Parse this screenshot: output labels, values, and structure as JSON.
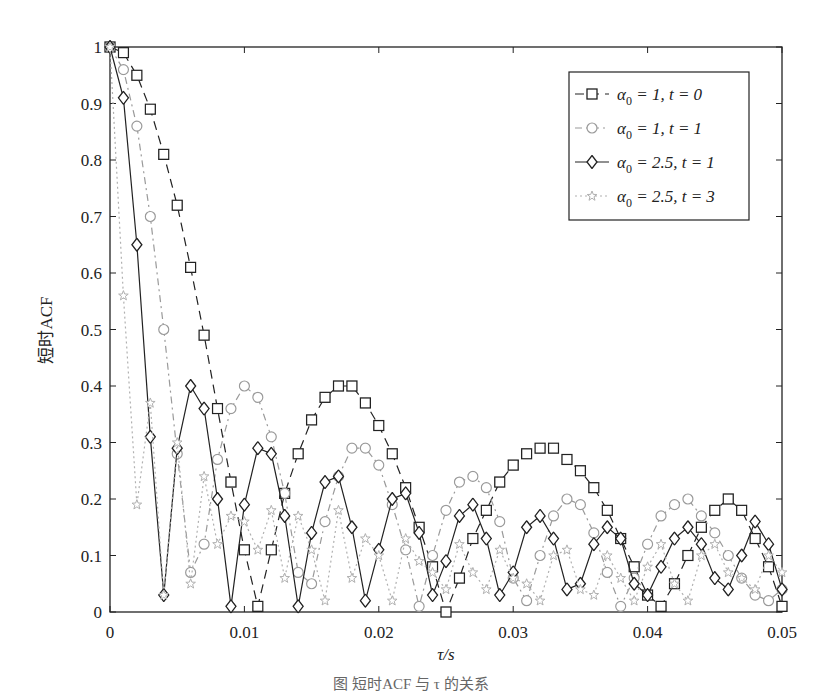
{
  "chart_data": {
    "type": "line",
    "title": "",
    "xlabel": "τ/s",
    "ylabel": "短时ACF",
    "xlim": [
      0,
      0.05
    ],
    "ylim": [
      0,
      1
    ],
    "xticks": [
      0,
      0.01,
      0.02,
      0.03,
      0.04,
      0.05
    ],
    "xtick_labels": [
      "0",
      "0.01",
      "0.02",
      "0.03",
      "0.04",
      "0.05"
    ],
    "yticks": [
      0,
      0.1,
      0.2,
      0.3,
      0.4,
      0.5,
      0.6,
      0.7,
      0.8,
      0.9,
      1
    ],
    "ytick_labels": [
      "0",
      "0.1",
      "0.2",
      "0.3",
      "0.4",
      "0.5",
      "0.6",
      "0.7",
      "0.8",
      "0.9",
      "1"
    ],
    "grid": false,
    "legend_position": "upper right",
    "x": [
      0,
      0.001,
      0.002,
      0.003,
      0.004,
      0.005,
      0.006,
      0.007,
      0.008,
      0.009,
      0.01,
      0.011,
      0.012,
      0.013,
      0.014,
      0.015,
      0.016,
      0.017,
      0.018,
      0.019,
      0.02,
      0.021,
      0.022,
      0.023,
      0.024,
      0.025,
      0.026,
      0.027,
      0.028,
      0.029,
      0.03,
      0.031,
      0.032,
      0.033,
      0.034,
      0.035,
      0.036,
      0.037,
      0.038,
      0.039,
      0.04,
      0.041,
      0.042,
      0.043,
      0.044,
      0.045,
      0.046,
      0.047,
      0.048,
      0.049,
      0.05
    ],
    "series": [
      {
        "name": "α0 = 1,  t = 0",
        "legend_main": "α",
        "legend_sub": "0",
        "legend_rest": " = 1,  t = 0",
        "marker": "square",
        "line_style": "dashed",
        "color": "#222222",
        "values": [
          1.0,
          0.99,
          0.95,
          0.89,
          0.81,
          0.72,
          0.61,
          0.49,
          0.36,
          0.23,
          0.11,
          0.01,
          0.11,
          0.21,
          0.28,
          0.34,
          0.38,
          0.4,
          0.4,
          0.37,
          0.33,
          0.28,
          0.22,
          0.15,
          0.08,
          0.0,
          0.06,
          0.13,
          0.18,
          0.23,
          0.26,
          0.28,
          0.29,
          0.29,
          0.27,
          0.25,
          0.22,
          0.18,
          0.13,
          0.08,
          0.03,
          0.01,
          0.05,
          0.1,
          0.15,
          0.18,
          0.2,
          0.18,
          0.13,
          0.08,
          0.01
        ]
      },
      {
        "name": "α0 = 1,  t = 1",
        "legend_main": "α",
        "legend_sub": "0",
        "legend_rest": " = 1,  t = 1",
        "marker": "circle",
        "line_style": "dashdot",
        "color": "#9a9a9a",
        "values": [
          1.0,
          0.96,
          0.86,
          0.7,
          0.5,
          0.28,
          0.07,
          0.12,
          0.27,
          0.36,
          0.4,
          0.38,
          0.31,
          0.21,
          0.07,
          0.05,
          0.16,
          0.24,
          0.29,
          0.29,
          0.26,
          0.19,
          0.11,
          0.01,
          0.1,
          0.18,
          0.23,
          0.24,
          0.22,
          0.16,
          0.06,
          0.02,
          0.1,
          0.17,
          0.2,
          0.19,
          0.14,
          0.07,
          0.01,
          0.06,
          0.12,
          0.17,
          0.19,
          0.2,
          0.17,
          0.14,
          0.1,
          0.06,
          0.03,
          0.02,
          0.04
        ]
      },
      {
        "name": "α0 = 2.5,  t = 1",
        "legend_main": "α",
        "legend_sub": "0",
        "legend_rest": " = 2.5,  t = 1",
        "marker": "diamond",
        "line_style": "solid",
        "color": "#222222",
        "values": [
          1.0,
          0.91,
          0.65,
          0.31,
          0.03,
          0.29,
          0.4,
          0.36,
          0.2,
          0.01,
          0.19,
          0.29,
          0.28,
          0.17,
          0.01,
          0.14,
          0.23,
          0.24,
          0.15,
          0.02,
          0.11,
          0.2,
          0.21,
          0.14,
          0.03,
          0.09,
          0.17,
          0.19,
          0.13,
          0.03,
          0.07,
          0.15,
          0.17,
          0.13,
          0.04,
          0.05,
          0.12,
          0.15,
          0.13,
          0.05,
          0.03,
          0.08,
          0.13,
          0.15,
          0.12,
          0.06,
          0.04,
          0.1,
          0.16,
          0.12,
          0.04
        ]
      },
      {
        "name": "α0 = 2.5,  t = 3",
        "legend_main": "α",
        "legend_sub": "0",
        "legend_rest": " = 2.5,  t = 3",
        "marker": "star",
        "line_style": "dotted",
        "color": "#b0b0b0",
        "values": [
          1.0,
          0.56,
          0.19,
          0.37,
          0.03,
          0.3,
          0.05,
          0.24,
          0.12,
          0.17,
          0.16,
          0.11,
          0.18,
          0.06,
          0.17,
          0.11,
          0.02,
          0.18,
          0.06,
          0.13,
          0.1,
          0.02,
          0.13,
          0.09,
          0.07,
          0.04,
          0.12,
          0.07,
          0.04,
          0.11,
          0.06,
          0.05,
          0.02,
          0.1,
          0.11,
          0.04,
          0.03,
          0.1,
          0.06,
          0.02,
          0.08,
          0.12,
          0.05,
          0.02,
          0.1,
          0.12,
          0.07,
          0.06,
          0.04,
          0.1,
          0.07
        ]
      }
    ]
  },
  "caption": "图  短时ACF 与 τ 的关系"
}
